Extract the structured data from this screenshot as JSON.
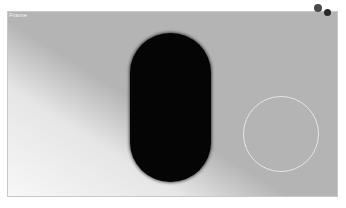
{
  "viewport": {
    "label": "Frame",
    "background_color": "#b4b4b4"
  },
  "objects": {
    "capsule": {
      "color": "#050505"
    },
    "ring": {
      "color": "#e6e6e6"
    },
    "markers": [
      {
        "color": "#4a4a4a"
      },
      {
        "color": "#2a2a2a"
      }
    ]
  },
  "caption": {
    "text": ""
  }
}
